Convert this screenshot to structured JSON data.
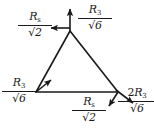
{
  "figure": {
    "type": "vector-force-diagram",
    "stroke_color": "#1a1a1a",
    "background_color": "#ffffff"
  },
  "triangle": {
    "apex": {
      "x": 70,
      "y": 31
    },
    "bottom_left": {
      "x": 36,
      "y": 92
    },
    "bottom_right": {
      "x": 118,
      "y": 92
    }
  },
  "labels": {
    "top_left": {
      "numerator_symbol": "R",
      "numerator_subscript": "s",
      "denominator_radical": "√",
      "denominator_value": "2",
      "full_text": "R_s/√2"
    },
    "top_right": {
      "numerator_symbol": "R",
      "numerator_subscript": "3",
      "denominator_radical": "√",
      "denominator_value": "6",
      "full_text": "R_3/√6"
    },
    "left": {
      "numerator_symbol": "R",
      "numerator_subscript": "3",
      "denominator_radical": "√",
      "denominator_value": "6",
      "full_text": "R_3/√6"
    },
    "bottom": {
      "numerator_symbol": "R",
      "numerator_subscript": "s",
      "denominator_radical": "√",
      "denominator_value": "2",
      "full_text": "R_s/√2"
    },
    "bottom_right": {
      "numerator_coefficient": "2",
      "numerator_symbol": "R",
      "numerator_subscript": "3",
      "denominator_radical": "√",
      "denominator_value": "6",
      "full_text": "2R_3/√6"
    }
  },
  "vectors": [
    {
      "name": "apex-up-arrow",
      "from": {
        "x": 70,
        "y": 31
      },
      "to": {
        "x": 70,
        "y": 6
      },
      "direction": "up"
    },
    {
      "name": "apex-left-arrow",
      "from": {
        "x": 70,
        "y": 31
      },
      "to": {
        "x": 47,
        "y": 27
      },
      "direction": "left"
    },
    {
      "name": "bottom-left-upright-arrow",
      "from": {
        "x": 36,
        "y": 92
      },
      "to": {
        "x": 53,
        "y": 78
      },
      "direction": "up-right"
    },
    {
      "name": "bottom-right-down-arrow",
      "from": {
        "x": 118,
        "y": 92
      },
      "to": {
        "x": 107,
        "y": 108
      },
      "direction": "down-left"
    },
    {
      "name": "bottom-right-out-arrow",
      "from": {
        "x": 118,
        "y": 92
      },
      "to": {
        "x": 136,
        "y": 105
      },
      "direction": "down-right"
    }
  ]
}
